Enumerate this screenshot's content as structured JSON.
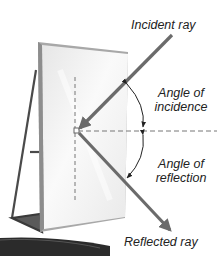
{
  "diagram": {
    "labels": {
      "incident_ray": "Incident ray",
      "angle_incidence_line1": "Angle of",
      "angle_incidence_line2": "incidence",
      "angle_reflection_line1": "Angle of",
      "angle_reflection_line2": "reflection",
      "reflected_ray": "Reflected ray"
    },
    "colors": {
      "ray": "#6b6b6b",
      "frame": "#9a9a9a",
      "mirror": "#f0f0f0",
      "stand": "#4a4a4a",
      "ground": "#2b2b2b"
    }
  }
}
